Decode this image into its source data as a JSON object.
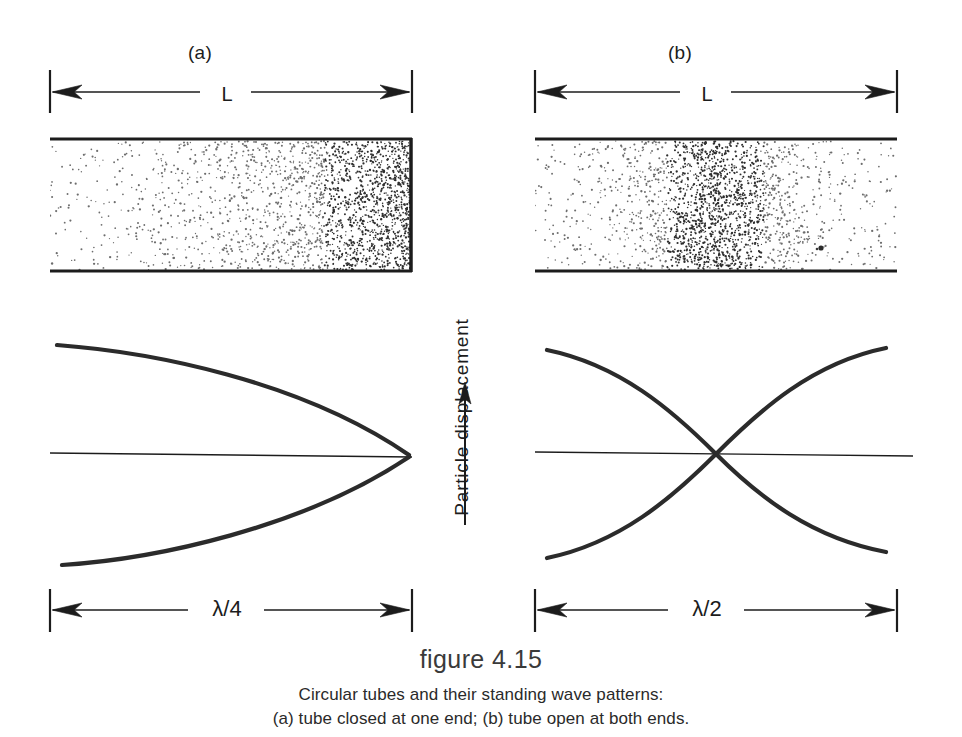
{
  "figure": {
    "number": "figure 4.15",
    "caption_lines": [
      "Circular tubes and their standing wave patterns:",
      "(a) tube closed at one end; (b) tube open at both ends."
    ],
    "axis_label": "Particle  displacement",
    "ink_color": "#1c1c1c",
    "background_color": "#ffffff"
  },
  "panels": [
    {
      "id": "a",
      "label": "(a)",
      "length_label": "L",
      "wavelength_label": "λ/4",
      "wavelength_lambda": "λ",
      "wavelength_fraction": "4",
      "tube_type": "closed at one end",
      "closed_end": "right",
      "open_end": "left",
      "density_description": "particle density increases toward closed right end",
      "wave_pattern": "quarter wavelength: displacement antinode at open left end, node at closed right end"
    },
    {
      "id": "b",
      "label": "(b)",
      "length_label": "L",
      "wavelength_label": "λ/2",
      "wavelength_lambda": "λ",
      "wavelength_fraction": "2",
      "tube_type": "open at both ends",
      "closed_end": "none",
      "open_end": "both",
      "density_description": "particle density peaks at tube center",
      "wave_pattern": "half wavelength: displacement antinodes at both open ends, node at center"
    }
  ],
  "chart_data": {
    "type": "line",
    "title": "figure 4.15",
    "subtitle": "Circular tubes and their standing wave patterns: (a) tube closed at one end; (b) tube open at both ends.",
    "xlabel": "",
    "ylabel": "Particle  displacement",
    "grid": false,
    "legend": "none",
    "panels": [
      {
        "name": "(a) tube closed at one end",
        "xlim": [
          0,
          1
        ],
        "ylim": [
          -1,
          1
        ],
        "x_axis_span_label": "λ/4",
        "tube_length_label": "L",
        "series": [
          {
            "name": "upper envelope",
            "comment": "cos(pi*x/2) quarter-cosine from +1 at x=0 to 0 at x=1",
            "x": [
              0,
              0.1,
              0.2,
              0.3,
              0.4,
              0.5,
              0.6,
              0.7,
              0.8,
              0.9,
              1.0
            ],
            "values": [
              1.0,
              0.988,
              0.951,
              0.891,
              0.809,
              0.707,
              0.588,
              0.454,
              0.309,
              0.156,
              0.0
            ]
          },
          {
            "name": "lower envelope",
            "comment": "-cos(pi*x/2) mirror of upper envelope",
            "x": [
              0,
              0.1,
              0.2,
              0.3,
              0.4,
              0.5,
              0.6,
              0.7,
              0.8,
              0.9,
              1.0
            ],
            "values": [
              -1.0,
              -0.988,
              -0.951,
              -0.891,
              -0.809,
              -0.707,
              -0.588,
              -0.454,
              -0.309,
              -0.156,
              0.0
            ]
          },
          {
            "name": "zero axis",
            "comment": "reference line of zero particle displacement",
            "x": [
              0,
              1
            ],
            "values": [
              0,
              0
            ]
          }
        ]
      },
      {
        "name": "(b) tube open at both ends",
        "xlim": [
          0,
          1
        ],
        "ylim": [
          -1,
          1
        ],
        "x_axis_span_label": "λ/2",
        "tube_length_label": "L",
        "series": [
          {
            "name": "upper envelope",
            "comment": "cos(pi*x) half-cosine from +1 at x=0 through 0 at x=0.5 to -1 at x=1",
            "x": [
              0,
              0.1,
              0.2,
              0.3,
              0.4,
              0.5,
              0.6,
              0.7,
              0.8,
              0.9,
              1.0
            ],
            "values": [
              1.0,
              0.951,
              0.809,
              0.588,
              0.309,
              0.0,
              -0.309,
              -0.588,
              -0.809,
              -0.951,
              -1.0
            ]
          },
          {
            "name": "lower envelope",
            "comment": "-cos(pi*x) mirror of upper envelope",
            "x": [
              0,
              0.1,
              0.2,
              0.3,
              0.4,
              0.5,
              0.6,
              0.7,
              0.8,
              0.9,
              1.0
            ],
            "values": [
              -1.0,
              -0.951,
              -0.809,
              -0.588,
              -0.309,
              0.0,
              0.309,
              0.588,
              0.809,
              0.951,
              1.0
            ]
          },
          {
            "name": "zero axis",
            "comment": "reference line of zero particle displacement",
            "x": [
              0,
              1
            ],
            "values": [
              0,
              0
            ]
          }
        ]
      }
    ],
    "gas_density": [
      {
        "panel": "(a)",
        "comment": "stipple density along tube, left(open) to right(closed), relative 0-1",
        "x": [
          0.0,
          0.1,
          0.2,
          0.3,
          0.4,
          0.5,
          0.6,
          0.7,
          0.8,
          0.9,
          1.0
        ],
        "values": [
          0.06,
          0.08,
          0.1,
          0.13,
          0.17,
          0.23,
          0.31,
          0.44,
          0.62,
          0.85,
          1.0
        ]
      },
      {
        "panel": "(b)",
        "comment": "stipple density along tube, peaks at center (pressure antinode)",
        "x": [
          0.0,
          0.1,
          0.2,
          0.3,
          0.4,
          0.5,
          0.6,
          0.7,
          0.8,
          0.9,
          1.0
        ],
        "values": [
          0.08,
          0.1,
          0.14,
          0.3,
          0.68,
          1.0,
          0.68,
          0.3,
          0.14,
          0.1,
          0.08
        ]
      }
    ]
  }
}
